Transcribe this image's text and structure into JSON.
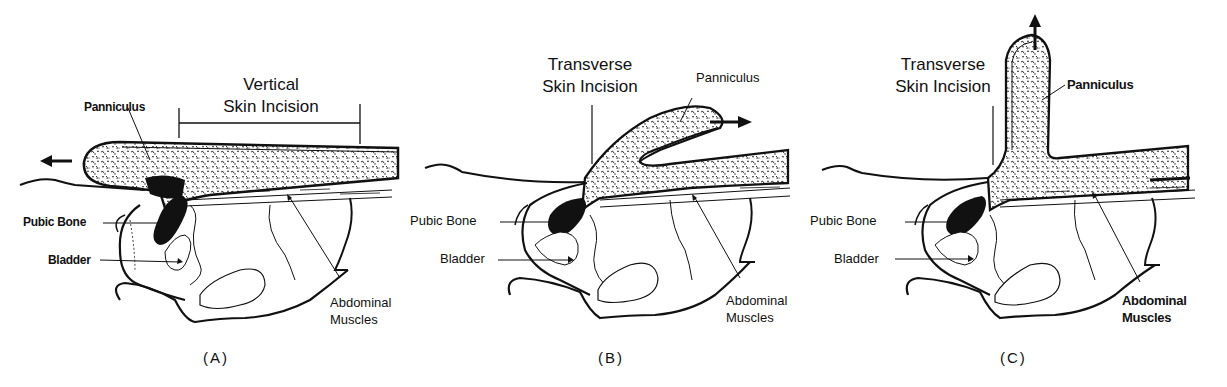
{
  "figure": {
    "panels": [
      {
        "id": "A",
        "caption": "(A)",
        "incision_label_line1": "Vertical",
        "incision_label_line2": "Skin Incision",
        "panniculus_label": "Panniculus",
        "pubic_bone_label": "Pubic Bone",
        "bladder_label": "Bladder",
        "muscles_label_line1": "Abdominal",
        "muscles_label_line2": "Muscles",
        "arrow_direction": "left"
      },
      {
        "id": "B",
        "caption": "(B)",
        "incision_label_line1": "Transverse",
        "incision_label_line2": "Skin Incision",
        "panniculus_label": "Panniculus",
        "pubic_bone_label": "Pubic Bone",
        "bladder_label": "Bladder",
        "muscles_label_line1": "Abdominal",
        "muscles_label_line2": "Muscles",
        "arrow_direction": "right"
      },
      {
        "id": "C",
        "caption": "(C)",
        "incision_label_line1": "Transverse",
        "incision_label_line2": "Skin Incision",
        "panniculus_label": "Panniculus",
        "pubic_bone_label": "Pubic Bone",
        "bladder_label": "Bladder",
        "muscles_label_line1": "Abdominal",
        "muscles_label_line2": "Muscles",
        "arrow_direction": "up"
      }
    ],
    "colors": {
      "ink": "#111111",
      "fat_fill": "#e8e8e8",
      "background": "#ffffff"
    }
  }
}
